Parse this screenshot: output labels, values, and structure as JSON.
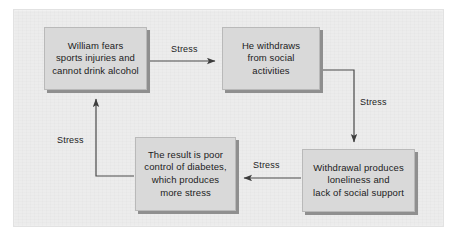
{
  "diagram": {
    "colors": {
      "page_background": "#ffffff",
      "panel_background": "#ececec",
      "node_fill": "#d9d9d9",
      "node_border": "#b9b9b9",
      "node_shadow": "#8f8f8f",
      "connector": "#4a4a4a",
      "text": "#1c1c1c"
    },
    "nodes": [
      {
        "id": "william",
        "text": "William fears\nsports injuries and\ncannot drink alcohol"
      },
      {
        "id": "withdraws",
        "text": "He withdraws\nfrom social\nactivities"
      },
      {
        "id": "loneliness",
        "text": "Withdrawal produces\nloneliness and\nlack of social support"
      },
      {
        "id": "result",
        "text": "The result is poor\ncontrol of diabetes,\nwhich produces\nmore stress"
      }
    ],
    "edges": [
      {
        "id": "william-to-withdraws",
        "label": "Stress",
        "from": "william",
        "to": "withdraws",
        "direction": "right"
      },
      {
        "id": "withdraws-to-loneliness",
        "label": "Stress",
        "from": "withdraws",
        "to": "loneliness",
        "direction": "down"
      },
      {
        "id": "loneliness-to-result",
        "label": "Stress",
        "from": "loneliness",
        "to": "result",
        "direction": "left"
      },
      {
        "id": "result-to-william",
        "label": "Stress",
        "from": "result",
        "to": "william",
        "direction": "up"
      }
    ]
  }
}
